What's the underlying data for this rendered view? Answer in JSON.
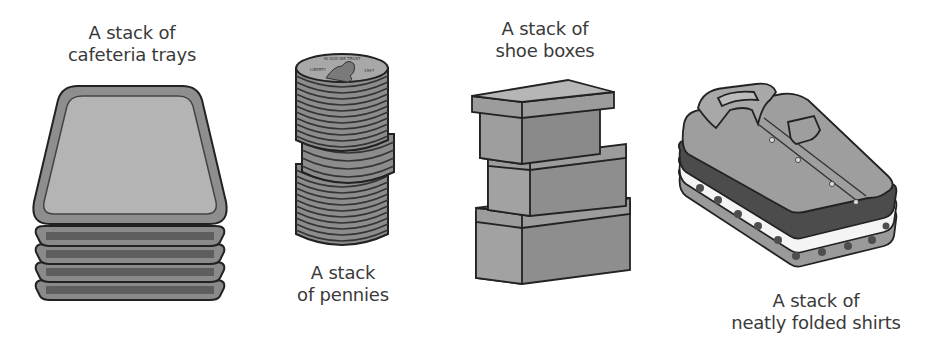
{
  "figure": {
    "type": "illustration",
    "background": "#ffffff",
    "fill_gray": "#9a9a9a",
    "stroke": "#222222",
    "items": [
      {
        "id": "trays",
        "caption_lines": [
          "A stack of",
          "cafeteria trays"
        ],
        "caption_position": "above",
        "count": 5
      },
      {
        "id": "pennies",
        "caption_lines": [
          "A stack",
          "of pennies"
        ],
        "caption_position": "below",
        "coin_text": {
          "motto": "IN GOD WE TRUST",
          "left": "LIBERTY",
          "year": "1997"
        }
      },
      {
        "id": "shoe-boxes",
        "caption_lines": [
          "A stack of",
          "shoe boxes"
        ],
        "caption_position": "above",
        "count": 3
      },
      {
        "id": "shirts",
        "caption_lines": [
          "A stack of",
          "neatly folded shirts"
        ],
        "caption_position": "below",
        "count": 4
      }
    ]
  }
}
